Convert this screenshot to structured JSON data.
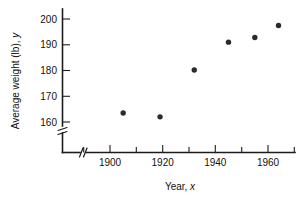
{
  "chart_data": {
    "type": "scatter",
    "title": "",
    "xlabel": "Year, x",
    "ylabel": "Average weight (lb), y",
    "xlim": [
      1888,
      1972
    ],
    "ylim": [
      156,
      203
    ],
    "grid": false,
    "legend": "none",
    "axis_break_x": true,
    "axis_break_y": true,
    "x_tick_labels": [
      "1900",
      "1920",
      "1940",
      "1960"
    ],
    "x_tick_values": [
      1900,
      1920,
      1940,
      1960
    ],
    "x_minor_ticks": [
      1890,
      1910,
      1930,
      1950,
      1970
    ],
    "y_tick_labels": [
      "160",
      "170",
      "180",
      "190",
      "200"
    ],
    "y_tick_values": [
      160,
      170,
      180,
      190,
      200
    ],
    "points": [
      {
        "x": 1905,
        "y": 163.5
      },
      {
        "x": 1919,
        "y": 162.0
      },
      {
        "x": 1932,
        "y": 180.2
      },
      {
        "x": 1945,
        "y": 191.0
      },
      {
        "x": 1955,
        "y": 192.8
      },
      {
        "x": 1964,
        "y": 197.5
      }
    ],
    "marker_color": "#2b2b2b",
    "axis_color": "#1c1c1c"
  },
  "labels": {
    "y_axis_title_main": "Average weight (lb), ",
    "y_axis_title_var": "y",
    "x_axis_title_main": "Year, ",
    "x_axis_title_var": "x",
    "y_200": "200",
    "y_190": "190",
    "y_180": "180",
    "y_170": "170",
    "y_160": "160",
    "x_1900": "1900",
    "x_1920": "1920",
    "x_1940": "1940",
    "x_1960": "1960"
  }
}
